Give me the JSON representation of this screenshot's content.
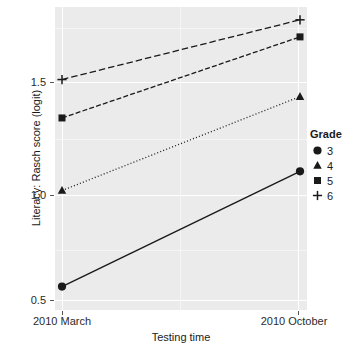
{
  "chart_data": {
    "type": "line",
    "title": "",
    "xlabel": "Testing time",
    "ylabel": "Literacy: Rasch score (logit)",
    "categories": [
      "2010 March",
      "2010 October"
    ],
    "x": [
      0,
      1
    ],
    "xlim": [
      -0.05,
      1.05
    ],
    "ylim": [
      0.42,
      1.84
    ],
    "yticks": [
      "0.5",
      "1.0",
      "1.5"
    ],
    "ytick_values": [
      0.5,
      1.0,
      1.5
    ],
    "yminor_values": [
      0.75,
      1.25,
      1.75
    ],
    "grid": true,
    "legend_position": "right",
    "legend_title": "Grade",
    "series": [
      {
        "name": "3",
        "marker": "circle",
        "linestyle": "solid",
        "values": [
          0.53,
          1.07
        ]
      },
      {
        "name": "4",
        "marker": "triangle",
        "linestyle": "dotted",
        "values": [
          0.98,
          1.42
        ]
      },
      {
        "name": "5",
        "marker": "square",
        "linestyle": "dashdot",
        "values": [
          1.32,
          1.7
        ]
      },
      {
        "name": "6",
        "marker": "plus",
        "linestyle": "dashed",
        "values": [
          1.5,
          1.78
        ]
      }
    ]
  },
  "axes": {
    "y_title": "Literacy: Rasch score (logit)",
    "x_title": "Testing time",
    "y_tick_labels": [
      "1.5",
      "1.0",
      "0.5"
    ],
    "x_tick_labels": [
      "2010 March",
      "2010 October"
    ]
  },
  "legend": {
    "title": "Grade",
    "items": [
      {
        "label": "3",
        "icon": "filled-circle-marker-icon"
      },
      {
        "label": "4",
        "icon": "filled-triangle-marker-icon"
      },
      {
        "label": "5",
        "icon": "filled-square-marker-icon"
      },
      {
        "label": "6",
        "icon": "plus-marker-icon"
      }
    ]
  },
  "colors": {
    "panel_background": "#ebebeb",
    "grid_major": "#ffffff",
    "grid_minor": "#f5f5f5",
    "series": "#1a1a1a",
    "text": "#1a1a1a"
  }
}
